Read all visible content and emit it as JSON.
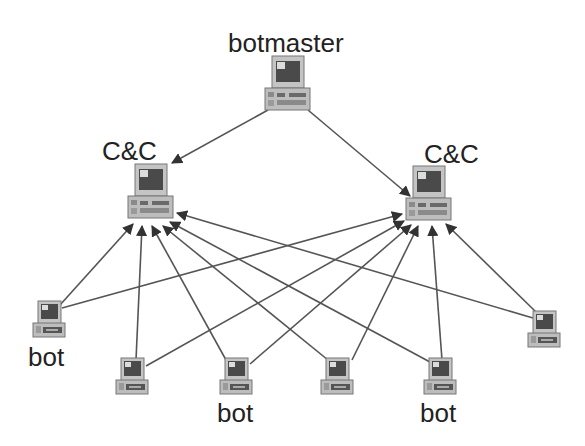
{
  "diagram": {
    "title": "",
    "colors": {
      "background": "#ffffff",
      "edge": "#555555",
      "label": "#222222",
      "computer_case": "#bdbdbd",
      "computer_screen": "#4a4a4a",
      "screen_highlight": "#dcdcdc"
    },
    "nodes": [
      {
        "id": "botmaster",
        "label": "botmaster",
        "type": "computer-icon",
        "x": 287,
        "y": 86,
        "size": "large"
      },
      {
        "id": "cc1",
        "label": "C&C",
        "type": "computer-icon",
        "x": 150,
        "y": 194,
        "size": "large"
      },
      {
        "id": "cc2",
        "label": "C&C",
        "type": "computer-icon",
        "x": 428,
        "y": 196,
        "size": "large"
      },
      {
        "id": "bot1",
        "label": "bot",
        "type": "computer-icon",
        "x": 49,
        "y": 319,
        "size": "small"
      },
      {
        "id": "bot2",
        "label": "",
        "type": "computer-icon",
        "x": 132,
        "y": 376,
        "size": "small"
      },
      {
        "id": "bot3",
        "label": "bot",
        "type": "computer-icon",
        "x": 236,
        "y": 376,
        "size": "small"
      },
      {
        "id": "bot4",
        "label": "",
        "type": "computer-icon",
        "x": 337,
        "y": 376,
        "size": "small"
      },
      {
        "id": "bot5",
        "label": "bot",
        "type": "computer-icon",
        "x": 440,
        "y": 376,
        "size": "small"
      },
      {
        "id": "bot6",
        "label": "",
        "type": "computer-icon",
        "x": 544,
        "y": 329,
        "size": "small"
      }
    ],
    "edges": [
      {
        "from": "botmaster",
        "to": "cc1",
        "directed": true
      },
      {
        "from": "botmaster",
        "to": "cc2",
        "directed": true
      },
      {
        "from": "bot1",
        "to": "cc1",
        "directed": true
      },
      {
        "from": "bot1",
        "to": "cc2",
        "directed": true
      },
      {
        "from": "bot2",
        "to": "cc1",
        "directed": true
      },
      {
        "from": "bot2",
        "to": "cc2",
        "directed": true
      },
      {
        "from": "bot3",
        "to": "cc1",
        "directed": true
      },
      {
        "from": "bot3",
        "to": "cc2",
        "directed": true
      },
      {
        "from": "bot4",
        "to": "cc1",
        "directed": true
      },
      {
        "from": "bot4",
        "to": "cc2",
        "directed": true
      },
      {
        "from": "bot5",
        "to": "cc1",
        "directed": true
      },
      {
        "from": "bot5",
        "to": "cc2",
        "directed": true
      },
      {
        "from": "bot6",
        "to": "cc1",
        "directed": true
      },
      {
        "from": "bot6",
        "to": "cc2",
        "directed": true
      }
    ],
    "labels": {
      "botmaster": "botmaster",
      "cc_left": "C&C",
      "cc_right": "C&C",
      "bot_left": "bot",
      "bot_middle": "bot",
      "bot_right": "bot"
    }
  }
}
